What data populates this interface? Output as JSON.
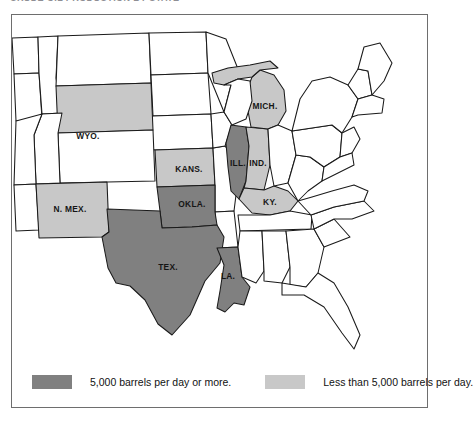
{
  "title": "CRUDE OIL PRODUCTION BY STATE",
  "frame": {
    "border_color": "#6e6e6e",
    "background": "#ffffff"
  },
  "colors": {
    "high": "#808080",
    "low": "#c8c8c8",
    "none": "#ffffff",
    "outline": "#1a1a1a",
    "label_text": "#151515"
  },
  "legend": {
    "items": [
      {
        "swatch": "high",
        "label": "5,000 barrels per day or more."
      },
      {
        "swatch": "low",
        "label": "Less than 5,000 barrels per day."
      }
    ]
  },
  "map_data": {
    "type": "choropleth",
    "region": "United States (contiguous, left edge cropped)",
    "classes": [
      {
        "key": "high",
        "color": "#808080",
        "label": "5,000 barrels per day or more."
      },
      {
        "key": "low",
        "color": "#c8c8c8",
        "label": "Less than 5,000 barrels per day."
      },
      {
        "key": "none",
        "color": "#ffffff",
        "label": "Not shaded"
      }
    ],
    "labeled_states": [
      {
        "label": "WYO.",
        "name": "Wyoming",
        "class": "low"
      },
      {
        "label": "KANS.",
        "name": "Kansas",
        "class": "low"
      },
      {
        "label": "N. MEX.",
        "name": "New Mexico",
        "class": "low"
      },
      {
        "label": "MICH.",
        "name": "Michigan",
        "class": "low"
      },
      {
        "label": "IND.",
        "name": "Indiana",
        "class": "low"
      },
      {
        "label": "KY.",
        "name": "Kentucky",
        "class": "low"
      },
      {
        "label": "OKLA.",
        "name": "Oklahoma",
        "class": "high"
      },
      {
        "label": "TEX.",
        "name": "Texas",
        "class": "high"
      },
      {
        "label": "LA.",
        "name": "Louisiana",
        "class": "high"
      },
      {
        "label": "ILL.",
        "name": "Illinois",
        "class": "high"
      }
    ],
    "counts": {
      "high": 4,
      "low": 6,
      "none": 38
    }
  },
  "labels": {
    "wyo": "WYO.",
    "kans": "KANS.",
    "nmex": "N. MEX.",
    "mich": "MICH.",
    "ill": "ILL.",
    "ind": "IND.",
    "ky": "KY.",
    "okla": "OKLA.",
    "tex": "TEX.",
    "la": "LA."
  }
}
